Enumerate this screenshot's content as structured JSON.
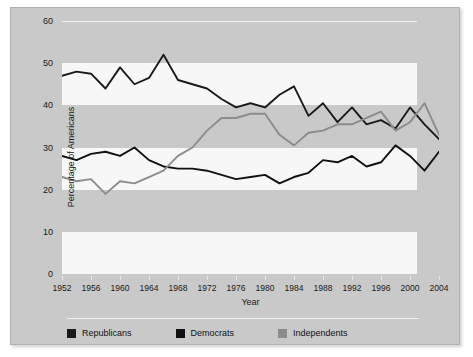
{
  "chart_data": {
    "type": "line",
    "title": "",
    "xlabel": "Year",
    "ylabel": "Percentage of Americans",
    "xlim": [
      1952,
      2004
    ],
    "ylim": [
      0,
      60
    ],
    "yticks": [
      0,
      10,
      20,
      30,
      40,
      50,
      60
    ],
    "xticks": [
      1952,
      1956,
      1960,
      1964,
      1968,
      1972,
      1976,
      1980,
      1984,
      1988,
      1992,
      1996,
      2000,
      2004
    ],
    "grid": "horizontal alternating bands",
    "legend_position": "bottom-left",
    "x": [
      1952,
      1954,
      1956,
      1958,
      1960,
      1962,
      1964,
      1966,
      1968,
      1970,
      1972,
      1974,
      1976,
      1978,
      1980,
      1982,
      1984,
      1986,
      1988,
      1990,
      1992,
      1994,
      1996,
      1998,
      2000,
      2002,
      2004
    ],
    "series": [
      {
        "name": "Republicans",
        "color": "#1a1a1a",
        "values": [
          47,
          48,
          47.5,
          44,
          49,
          45,
          46.5,
          52,
          46,
          45,
          44,
          41.5,
          39.5,
          40.5,
          39.5,
          42.5,
          44.5,
          37.5,
          40.5,
          36,
          39.5,
          35.5,
          36.5,
          34.5,
          39.5,
          35.5,
          32
        ]
      },
      {
        "name": "Democrats",
        "color": "#111111",
        "values": [
          28,
          27,
          28.5,
          29,
          28,
          30,
          27,
          25.5,
          25,
          25,
          24.5,
          23.5,
          22.5,
          23,
          23.5,
          21.5,
          23,
          24,
          27,
          26.5,
          28,
          25.5,
          26.5,
          30.5,
          28,
          24.5,
          29
        ]
      },
      {
        "name": "Independents",
        "color": "#8c8c8c",
        "values": [
          23,
          22,
          22.5,
          19,
          22,
          21.5,
          23,
          24.5,
          28,
          30,
          34,
          37,
          37,
          38,
          38,
          33,
          30.5,
          33.5,
          34,
          35.5,
          35.5,
          37,
          38.5,
          34,
          36,
          40.5,
          33
        ]
      }
    ]
  },
  "axes": {
    "ylabel": "Percentage of Americans",
    "xlabel": "Year",
    "ytick_labels": [
      "60",
      "50",
      "40",
      "30",
      "20",
      "10",
      "0"
    ],
    "xtick_labels": [
      "1952",
      "1956",
      "1960",
      "1964",
      "1968",
      "1972",
      "1976",
      "1980",
      "1984",
      "1988",
      "1992",
      "1996",
      "2000",
      "2004"
    ]
  },
  "legend": {
    "items": [
      {
        "label": "Republicans",
        "color": "#1a1a1a"
      },
      {
        "label": "Democrats",
        "color": "#111111"
      },
      {
        "label": "Independents",
        "color": "#8c8c8c"
      }
    ]
  },
  "colors": {
    "panel_background": "#c9c9c9",
    "band_light": "#f7f7f7",
    "band_dark": "#c9c9c9",
    "page_background": "#ffffff"
  }
}
